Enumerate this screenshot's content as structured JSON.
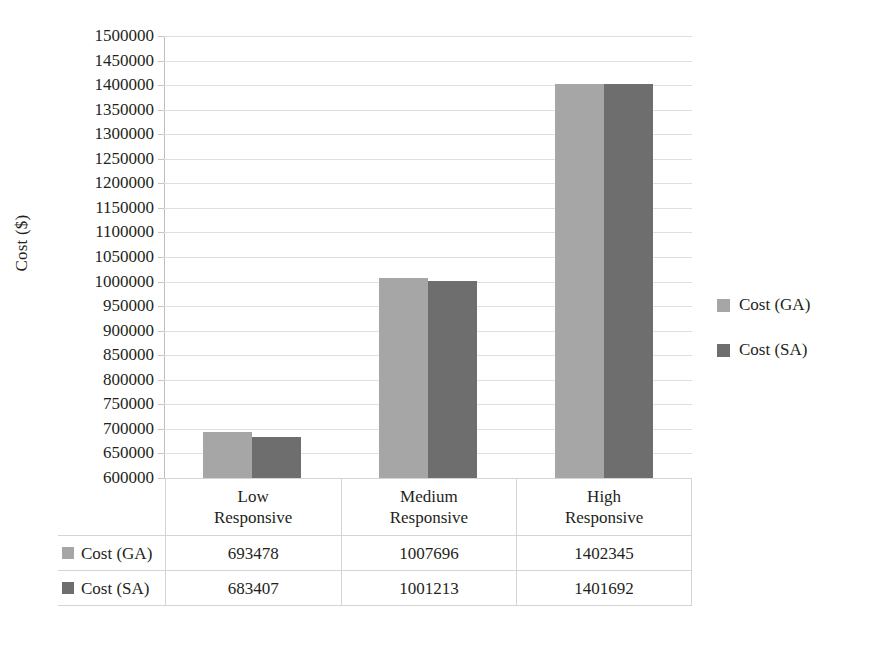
{
  "chart_data": {
    "type": "bar",
    "title": "",
    "xlabel": "",
    "ylabel": "Cost ($)",
    "ylim": [
      600000,
      1500000
    ],
    "ytick_step": 50000,
    "grid": true,
    "legend_position": "right",
    "categories": [
      "Low Responsive",
      "Medium Responsive",
      "High Responsive"
    ],
    "category_lines": [
      [
        "Low",
        "Responsive"
      ],
      [
        "Medium",
        "Responsive"
      ],
      [
        "High",
        "Responsive"
      ]
    ],
    "series": [
      {
        "name": "Cost (GA)",
        "color": "#a6a6a6",
        "values": [
          693478,
          1007696,
          1402345
        ]
      },
      {
        "name": "Cost (SA)",
        "color": "#6e6e6e",
        "values": [
          683407,
          1001213,
          1401692
        ]
      }
    ],
    "ytick_labels": [
      "1500000",
      "1450000",
      "1400000",
      "1350000",
      "1300000",
      "1250000",
      "1200000",
      "1150000",
      "1100000",
      "1050000",
      "1000000",
      "950000",
      "900000",
      "850000",
      "800000",
      "750000",
      "700000",
      "650000",
      "600000"
    ]
  },
  "legend": {
    "items": [
      {
        "label": "Cost (GA)",
        "color": "#a6a6a6"
      },
      {
        "label": "Cost (SA)",
        "color": "#6e6e6e"
      }
    ]
  },
  "table": {
    "corner": "",
    "column_headers": [
      {
        "line1": "Low",
        "line2": "Responsive"
      },
      {
        "line1": "Medium",
        "line2": "Responsive"
      },
      {
        "line1": "High",
        "line2": "Responsive"
      }
    ],
    "rows": [
      {
        "series": "Cost (GA)",
        "color": "#a6a6a6",
        "cells": [
          "693478",
          "1007696",
          "1402345"
        ]
      },
      {
        "series": "Cost (SA)",
        "color": "#6e6e6e",
        "cells": [
          "683407",
          "1001213",
          "1401692"
        ]
      }
    ]
  },
  "axis": {
    "y_title": "Cost ($)"
  }
}
